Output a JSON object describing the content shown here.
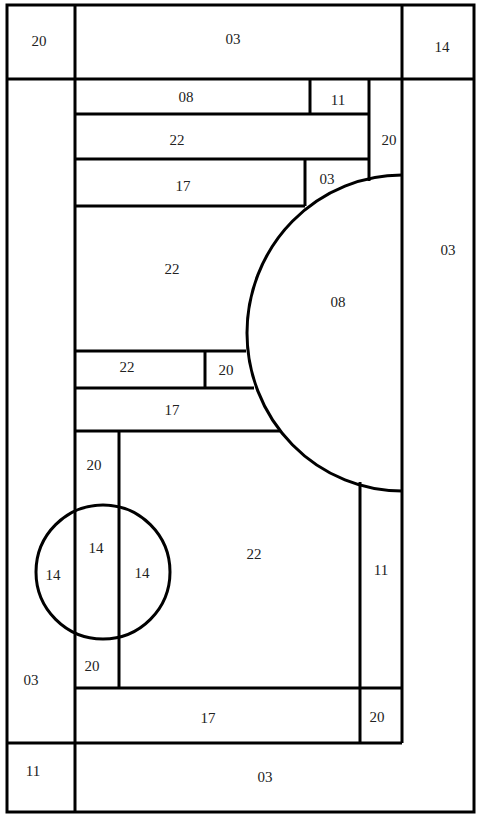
{
  "diagram": {
    "type": "region-label-puzzle",
    "line_color": "#000000",
    "background": "#ffffff",
    "labels": {
      "top_left": "20",
      "top_center": "03",
      "top_right": "14",
      "row1_left": "08",
      "row1_right": "11",
      "row2": "22",
      "col_right_upper": "20",
      "row3_left": "17",
      "row3_right": "03",
      "right_column": "03",
      "half_circle": "08",
      "mid_left_big": "22",
      "row4_left": "22",
      "row4_right": "20",
      "row5": "17",
      "narrow_col_top": "20",
      "circle_left": "14",
      "circle_center": "14",
      "circle_right": "14",
      "narrow_col_bottom": "20",
      "center_big": "22",
      "right_narrow_col": "11",
      "left_column": "03",
      "bottom_row": "17",
      "bottom_row_right": "20",
      "bottom_left": "11",
      "bottom_center": "03"
    }
  }
}
